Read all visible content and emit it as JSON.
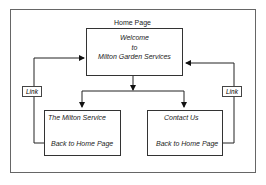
{
  "diagram": {
    "home": {
      "caption": "Home Page",
      "line1": "Welcome",
      "line2": "to",
      "line3": "Milton Garden Services"
    },
    "service": {
      "title": "The Milton Service",
      "back": "Back to Home Page"
    },
    "contact": {
      "title": "Contact Us",
      "back": "Back to Home Page"
    },
    "link_left": "Link",
    "link_right": "Link"
  }
}
